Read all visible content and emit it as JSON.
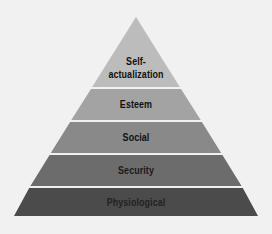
{
  "diagram": {
    "type": "pyramid",
    "title": "",
    "background": "#f1f1f1",
    "separator_color": "#f4f4f4",
    "levels": [
      {
        "label_line1": "Self-",
        "label_line2": "actualization",
        "color": "#bcbcbc"
      },
      {
        "label": "Esteem",
        "color": "#a3a3a3"
      },
      {
        "label": "Social",
        "color": "#898989"
      },
      {
        "label": "Security",
        "color": "#6c6c6c"
      },
      {
        "label": "Physiological",
        "color": "#4b4b4b"
      }
    ]
  }
}
